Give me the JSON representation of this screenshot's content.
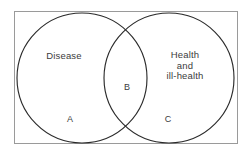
{
  "figure": {
    "type": "venn-diagram",
    "background_color": "#ffffff",
    "frame": {
      "name": "universe-rectangle",
      "stroke_color": "#9a9a9a",
      "x": 14,
      "y": 11,
      "width": 224,
      "height": 133
    },
    "circles": [
      {
        "name": "disease-circle",
        "cx": 82,
        "cy": 78,
        "r": 65,
        "stroke_color": "#2b2b2b"
      },
      {
        "name": "health-circle",
        "cx": 169,
        "cy": 78,
        "r": 65,
        "stroke_color": "#2b2b2b"
      }
    ],
    "set_labels": {
      "left": "Disease",
      "right": "Health\nand\nill-health"
    },
    "region_labels": {
      "left_only": "A",
      "intersection": "B",
      "right_only": "C"
    },
    "text_color": "#3c3c3c"
  }
}
